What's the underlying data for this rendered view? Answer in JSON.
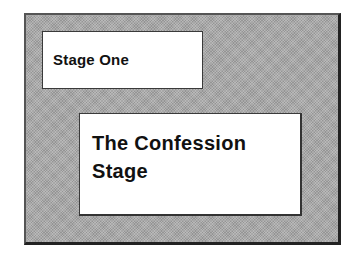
{
  "diagram": {
    "background_color": "#a9a9a9",
    "boxes": [
      {
        "id": "stage-one",
        "lines": [
          "Stage One"
        ]
      },
      {
        "id": "confession-stage",
        "lines": [
          "The Confession",
          "Stage"
        ]
      }
    ]
  }
}
